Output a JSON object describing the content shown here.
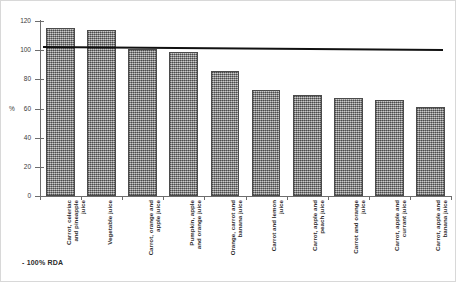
{
  "chart_data": {
    "type": "bar",
    "title": "",
    "xlabel": "",
    "ylabel": "%",
    "ylim": [
      0,
      120
    ],
    "yticks": [
      0,
      20,
      40,
      60,
      80,
      100,
      120
    ],
    "grid": false,
    "legend_position": "below-left",
    "categories": [
      "Carrot, celeriac and pineapple juice",
      "Vegetable juice",
      "Carrot, orange and apple juice",
      "Pumpkin, apple and orange juice",
      "Orange, carrot and banana juice",
      "Carrot and lemon juice",
      "Carrot, apple and peach juice",
      "Carrot and orange juice",
      "Carrot, apple and currant juice",
      "Carrot, apple and banana juice"
    ],
    "category_lines": [
      [
        "Carrot, celeriac",
        "and pineapple",
        "juice"
      ],
      [
        "Vegetable juice"
      ],
      [
        "Carrot, orange and",
        "apple juice"
      ],
      [
        "Pumpkin, apple",
        "and orange juice"
      ],
      [
        "Orange, carrot and",
        "banana juice"
      ],
      [
        "Carrot and lemon",
        "juice"
      ],
      [
        "Carrot, apple and",
        "peach juice"
      ],
      [
        "Carrot and orange",
        "juice"
      ],
      [
        "Carrot, apple and",
        "currant juice"
      ],
      [
        "Carrot, apple and",
        "banana juice"
      ]
    ],
    "values": [
      115,
      114,
      101,
      99,
      86,
      73,
      69,
      67,
      66,
      61
    ],
    "series": [
      {
        "name": "% RDA",
        "values": [
          115,
          114,
          101,
          99,
          86,
          73,
          69,
          67,
          66,
          61
        ]
      }
    ],
    "reference_line": {
      "label": "100% RDA",
      "value": 100,
      "color": "#111111"
    },
    "bar_color": "#9a9a9a",
    "bar_border_color": "#4b4b4b"
  },
  "legend": {
    "entry": "- 100% RDA"
  },
  "axis": {
    "y_title": "%",
    "tick_labels": [
      "120",
      "100",
      "80",
      "60",
      "40",
      "20",
      "0"
    ]
  }
}
